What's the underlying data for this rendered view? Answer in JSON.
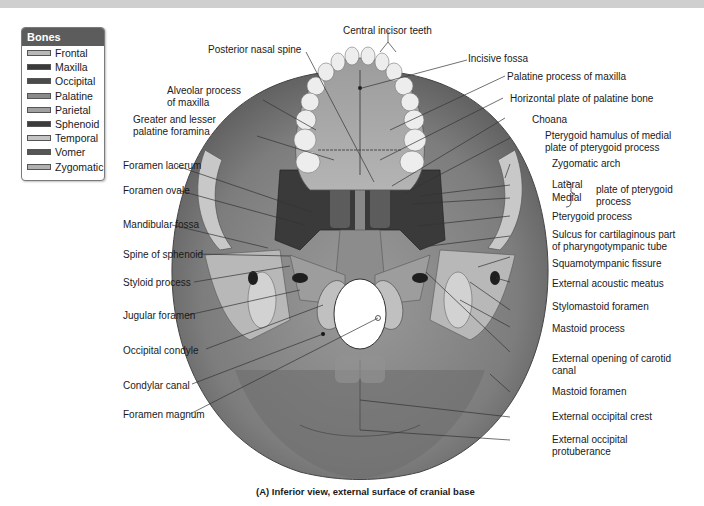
{
  "legend": {
    "title": "Bones",
    "items": [
      {
        "label": "Frontal",
        "color": "#b8b8b8"
      },
      {
        "label": "Maxilla",
        "color": "#3a3a3a"
      },
      {
        "label": "Occipital",
        "color": "#4a4a4a"
      },
      {
        "label": "Palatine",
        "color": "#8a8a8a"
      },
      {
        "label": "Parietal",
        "color": "#a0a0a0"
      },
      {
        "label": "Sphenoid",
        "color": "#3c3c3c"
      },
      {
        "label": "Temporal",
        "color": "#c4c4c4"
      },
      {
        "label": "Vomer",
        "color": "#555555"
      },
      {
        "label": "Zygomatic",
        "color": "#b0b0b0"
      }
    ]
  },
  "labels": {
    "central_incisor_teeth": "Central incisor teeth",
    "posterior_nasal_spine": "Posterior nasal spine",
    "incisive_fossa": "Incisive fossa",
    "palatine_process_of_maxilla": "Palatine process of maxilla",
    "alveolar_process_1": "Alveolar process",
    "alveolar_process_2": "of maxilla",
    "horizontal_plate": "Horizontal plate of palatine bone",
    "greater_lesser_1": "Greater and lesser",
    "greater_lesser_2": "palatine foramina",
    "choana": "Choana",
    "pterygoid_hamulus_1": "Pterygoid hamulus of medial",
    "pterygoid_hamulus_2": "plate of pterygoid process",
    "zygomatic_arch": "Zygomatic arch",
    "foramen_lacerum": "Foramen lacerum",
    "lateral": "Lateral",
    "medial": "Medial",
    "plate_of_pterygoid_1": "plate of pterygoid",
    "plate_of_pterygoid_2": "process",
    "foramen_ovale": "Foramen ovale",
    "pterygoid_process": "Pterygoid process",
    "mandibular_fossa": "Mandibular fossa",
    "sulcus_1": "Sulcus for cartilaginous part",
    "sulcus_2": "of pharyngotympanic tube",
    "spine_of_sphenoid": "Spine of sphenoid",
    "squamotympanic_fissure": "Squamotympanic fissure",
    "styloid_process": "Styloid process",
    "external_acoustic_meatus": "External acoustic meatus",
    "stylomastoid_foramen": "Stylomastoid foramen",
    "jugular_foramen": "Jugular foramen",
    "mastoid_process": "Mastoid process",
    "occipital_condyle": "Occipital condyle",
    "external_opening_carotid_1": "External opening of carotid",
    "external_opening_carotid_2": "canal",
    "condylar_canal": "Condylar canal",
    "mastoid_foramen": "Mastoid foramen",
    "external_occipital_crest": "External occipital crest",
    "foramen_magnum": "Foramen magnum",
    "external_occipital_protuberance_1": "External occipital",
    "external_occipital_protuberance_2": "protuberance"
  },
  "caption": "(A) Inferior view, external surface of cranial base"
}
